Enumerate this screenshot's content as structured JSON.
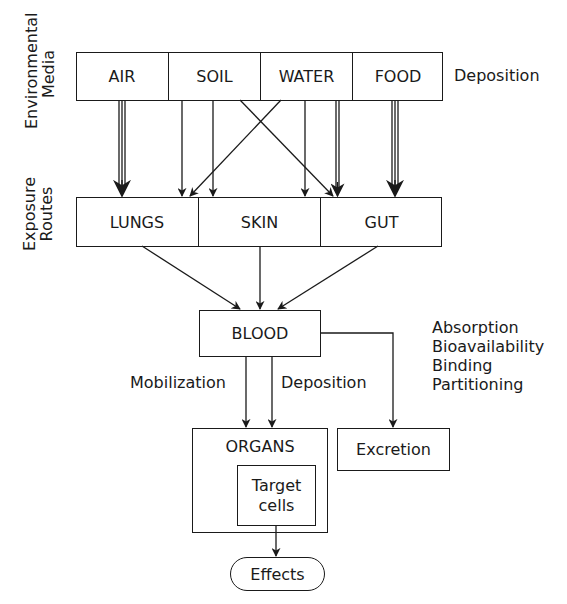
{
  "diagram": {
    "side_labels": {
      "environmental_media": [
        "Environmental",
        "Media"
      ],
      "exposure_routes": [
        "Exposure",
        "Routes"
      ]
    },
    "environmental_media": {
      "cells": [
        "AIR",
        "SOIL",
        "WATER",
        "FOOD"
      ],
      "side_label": "Deposition"
    },
    "exposure_routes": {
      "cells": [
        "LUNGS",
        "SKIN",
        "GUT"
      ]
    },
    "blood": {
      "label": "BLOOD"
    },
    "blood_to_organs": {
      "left_label": "Mobilization",
      "right_label": "Deposition"
    },
    "processes": [
      "Absorption",
      "Bioavailability",
      "Binding",
      "Partitioning"
    ],
    "organs": {
      "label": "ORGANS",
      "inner": [
        "Target",
        "cells"
      ]
    },
    "excretion": {
      "label": "Excretion"
    },
    "effects": {
      "label": "Effects"
    },
    "connections": [
      {
        "from": "AIR",
        "to": "LUNGS",
        "weight": "triple"
      },
      {
        "from": "SOIL",
        "to": "SKIN",
        "weight": "single"
      },
      {
        "from": "SOIL",
        "to": "SKIN",
        "weight": "single"
      },
      {
        "from": "SOIL",
        "to": "GUT",
        "weight": "single"
      },
      {
        "from": "WATER",
        "to": "SKIN",
        "weight": "single"
      },
      {
        "from": "WATER",
        "to": "GUT",
        "weight": "single"
      },
      {
        "from": "WATER",
        "to": "GUT",
        "weight": "double"
      },
      {
        "from": "FOOD",
        "to": "GUT",
        "weight": "triple"
      },
      {
        "from": "LUNGS",
        "to": "BLOOD",
        "weight": "single"
      },
      {
        "from": "SKIN",
        "to": "BLOOD",
        "weight": "single"
      },
      {
        "from": "GUT",
        "to": "BLOOD",
        "weight": "single"
      },
      {
        "from": "BLOOD",
        "to": "ORGANS",
        "weight": "single",
        "label": "Mobilization"
      },
      {
        "from": "BLOOD",
        "to": "ORGANS",
        "weight": "single",
        "label": "Deposition"
      },
      {
        "from": "BLOOD",
        "to": "Excretion",
        "weight": "single"
      },
      {
        "from": "Target cells",
        "to": "Effects",
        "weight": "single"
      }
    ]
  }
}
